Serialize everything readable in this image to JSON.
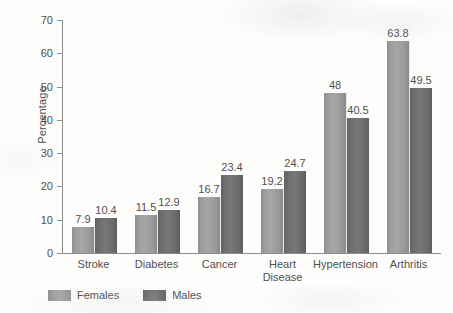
{
  "chart_data": {
    "type": "bar",
    "title": "",
    "subtitle": "",
    "xlabel": "",
    "ylabel": "Percentage",
    "ylim": [
      0,
      70
    ],
    "yticks": [
      0,
      10,
      20,
      30,
      40,
      50,
      60,
      70
    ],
    "ytick_labels": [
      "0",
      "10",
      "20",
      "30",
      "40",
      "50",
      "60",
      "70"
    ],
    "grid": false,
    "legend_position": "bottom-left",
    "categories": [
      "Stroke",
      "Diabetes",
      "Cancer",
      "Heart\nDisease",
      "Hypertension",
      "Arthritis"
    ],
    "series": [
      {
        "name": "Females",
        "color": "#a2a2a2",
        "values": [
          7.9,
          11.5,
          16.7,
          19.2,
          48,
          63.8
        ],
        "labels": [
          "7.9",
          "11.5",
          "16.7",
          "19.2",
          "48",
          "63.8"
        ]
      },
      {
        "name": "Males",
        "color": "#6e6e6e",
        "values": [
          10.4,
          12.9,
          23.4,
          24.7,
          40.5,
          49.5
        ],
        "labels": [
          "10.4",
          "12.9",
          "23.4",
          "24.7",
          "40.5",
          "49.5"
        ]
      }
    ]
  },
  "axis": {
    "line_color": "#8d8d8d",
    "text_color": "#4f4f4f"
  },
  "legend": {
    "items": [
      {
        "label": "Females",
        "swatch": "females"
      },
      {
        "label": "Males",
        "swatch": "males"
      }
    ]
  }
}
